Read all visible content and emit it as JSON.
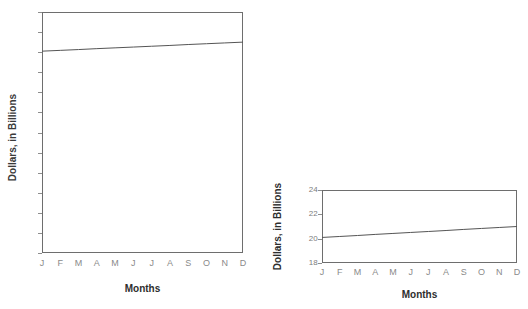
{
  "figure": {
    "background": "#ffffff",
    "line_color": "#555555",
    "axis_color": "#6e6e6e",
    "tick_text_color": "#7d7d7d",
    "title_text_color": "#2e2e2e"
  },
  "charts": [
    {
      "id": "chart-full",
      "name": "full-scale-chart",
      "chart_data": {
        "type": "line",
        "title": "",
        "xlabel": "Months",
        "ylabel": "Dollars, in Billions",
        "categories": [
          "J",
          "F",
          "M",
          "A",
          "M",
          "J",
          "J",
          "A",
          "S",
          "O",
          "N",
          "D"
        ],
        "x": [
          1,
          2,
          3,
          4,
          5,
          6,
          7,
          8,
          9,
          10,
          11,
          12
        ],
        "values": [
          20.1,
          20.18,
          20.26,
          20.35,
          20.43,
          20.51,
          20.59,
          20.67,
          20.76,
          20.84,
          20.92,
          21.0
        ],
        "series": [
          {
            "name": "Dollars",
            "values": [
              20.1,
              20.18,
              20.26,
              20.35,
              20.43,
              20.51,
              20.59,
              20.67,
              20.76,
              20.84,
              20.92,
              21.0
            ]
          }
        ],
        "ylim": [
          0,
          24
        ],
        "ytick_step": 2,
        "yticks": [
          24,
          22,
          20,
          18,
          16,
          14,
          12,
          10,
          8,
          6,
          4,
          2,
          0
        ],
        "xticks": [
          "J",
          "F",
          "M",
          "A",
          "M",
          "J",
          "J",
          "A",
          "S",
          "O",
          "N",
          "D"
        ],
        "grid": false,
        "legend": "none"
      }
    },
    {
      "id": "chart-truncated",
      "name": "truncated-scale-chart",
      "chart_data": {
        "type": "line",
        "title": "",
        "xlabel": "Months",
        "ylabel": "Dollars, in Billions",
        "categories": [
          "J",
          "F",
          "M",
          "A",
          "M",
          "J",
          "J",
          "A",
          "S",
          "O",
          "N",
          "D"
        ],
        "x": [
          1,
          2,
          3,
          4,
          5,
          6,
          7,
          8,
          9,
          10,
          11,
          12
        ],
        "values": [
          20.1,
          20.18,
          20.26,
          20.35,
          20.43,
          20.51,
          20.59,
          20.67,
          20.76,
          20.84,
          20.92,
          21.0
        ],
        "series": [
          {
            "name": "Dollars",
            "values": [
              20.1,
              20.18,
              20.26,
              20.35,
              20.43,
              20.51,
              20.59,
              20.67,
              20.76,
              20.84,
              20.92,
              21.0
            ]
          }
        ],
        "ylim": [
          18,
          24
        ],
        "ytick_step": 2,
        "yticks": [
          24,
          22,
          20,
          18
        ],
        "xticks": [
          "J",
          "F",
          "M",
          "A",
          "M",
          "J",
          "J",
          "A",
          "S",
          "O",
          "N",
          "D"
        ],
        "grid": false,
        "legend": "none"
      }
    }
  ]
}
